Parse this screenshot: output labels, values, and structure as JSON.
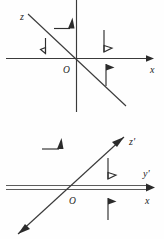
{
  "figure": {
    "panels": [
      {
        "name": "upper-panel",
        "origin_label": "O",
        "axes": [
          {
            "name": "x-axis",
            "label": "x",
            "direction": "right",
            "arrow": "single"
          },
          {
            "name": "vertical-axis",
            "label": "",
            "direction": "vertical",
            "arrow": "none"
          },
          {
            "name": "z-axis",
            "label": "z",
            "direction": "up-left",
            "arrow": "none"
          }
        ],
        "moment_arrows": [
          {
            "name": "moment-arrow-upper-left-horizontal",
            "orientation": "right-pointing-hook",
            "head": "filled-triangle"
          },
          {
            "name": "moment-arrow-upper-left-vertical",
            "orientation": "down-pointing-hook",
            "head": "open-triangle"
          },
          {
            "name": "moment-arrow-upper-right-down",
            "orientation": "down-pointing-hook",
            "head": "open-triangle"
          },
          {
            "name": "moment-arrow-upper-right-up",
            "orientation": "up-pointing-hook",
            "head": "filled-triangle"
          }
        ]
      },
      {
        "name": "lower-panel",
        "origin_label": "O",
        "axes": [
          {
            "name": "y-prime-axis",
            "label": "y'",
            "direction": "right",
            "arrow": "single"
          },
          {
            "name": "x-axis",
            "label": "x",
            "direction": "right",
            "arrow": "single"
          },
          {
            "name": "z-prime-axis",
            "label": "z'",
            "direction": "up-right",
            "arrow": "double"
          }
        ],
        "moment_arrows": [
          {
            "name": "moment-arrow-lower-left-horizontal",
            "orientation": "right-pointing-hook",
            "head": "filled-triangle"
          },
          {
            "name": "moment-arrow-lower-right-down",
            "orientation": "down-pointing-hook",
            "head": "open-triangle"
          },
          {
            "name": "moment-arrow-lower-right-up",
            "orientation": "up-pointing-hook",
            "head": "filled-triangle"
          }
        ]
      }
    ],
    "labels": {
      "z": "z",
      "x": "x",
      "o_upper": "O",
      "z_prime": "z'",
      "y_prime": "y'",
      "x_lower": "x",
      "o_lower": "O"
    },
    "colors": {
      "stroke": "#2e2e2e",
      "axis": "#3a3a3a",
      "background": "#fefefe",
      "text": "#1d1d1d"
    }
  }
}
